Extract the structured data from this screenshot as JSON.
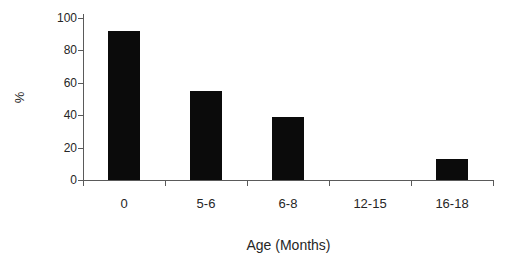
{
  "chart_data": {
    "type": "bar",
    "title": "",
    "xlabel": "Age (Months)",
    "ylabel": "%",
    "categories": [
      "0",
      "5-6",
      "6-8",
      "12-15",
      "16-18"
    ],
    "values": [
      92,
      55,
      39,
      0,
      13
    ],
    "ylim": [
      0,
      100
    ],
    "yticks": [
      0,
      20,
      40,
      60,
      80,
      100
    ],
    "grid": "off",
    "legend": "none",
    "bar_color": "#0b0b0b",
    "axis_color": "#5a5a5a",
    "text_color": "#262626",
    "background_color": "#ffffff"
  }
}
